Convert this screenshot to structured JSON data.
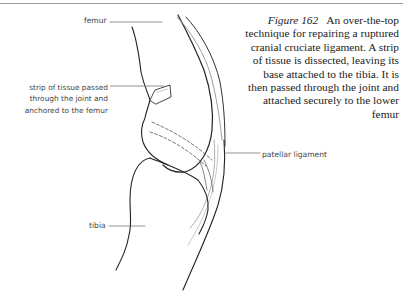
{
  "caption": {
    "figure_number": "Figure 162",
    "text": "An over-the-top technique for repairing a ruptured cranial cruciate ligament. A strip of tissue is dissected, leaving its base attached to the tibia. It is then passed through the joint and attached securely to the lower femur"
  },
  "labels": {
    "femur": "femur",
    "strip": "strip of tissue passed through the joint and anchored to the femur",
    "patellar": "patellar ligament",
    "tibia": "tibia"
  }
}
